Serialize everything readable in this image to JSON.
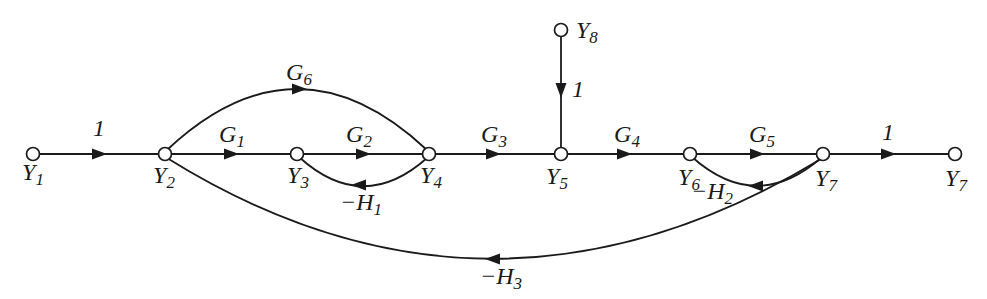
{
  "figure": {
    "type": "signal-flow-graph"
  },
  "colors": {
    "background": "#ffffff",
    "line": "#1a1a1a",
    "node_fill": "#ffffff"
  },
  "nodes": [
    {
      "id": "y1",
      "base": "Y",
      "sub": "1"
    },
    {
      "id": "y2",
      "base": "Y",
      "sub": "2"
    },
    {
      "id": "y3",
      "base": "Y",
      "sub": "3"
    },
    {
      "id": "y4",
      "base": "Y",
      "sub": "4"
    },
    {
      "id": "y5",
      "base": "Y",
      "sub": "5"
    },
    {
      "id": "y6",
      "base": "Y",
      "sub": "6"
    },
    {
      "id": "y7",
      "base": "Y",
      "sub": "7"
    },
    {
      "id": "y7-out",
      "base": "Y",
      "sub": "7"
    },
    {
      "id": "y8",
      "base": "Y",
      "sub": "8"
    }
  ],
  "edges": [
    {
      "id": "y1-y2",
      "from": "Y1",
      "to": "Y2",
      "label": "1",
      "sub": ""
    },
    {
      "id": "y2-y3",
      "from": "Y2",
      "to": "Y3",
      "label": "G",
      "sub": "1"
    },
    {
      "id": "y3-y4",
      "from": "Y3",
      "to": "Y4",
      "label": "G",
      "sub": "2"
    },
    {
      "id": "y4-y5",
      "from": "Y4",
      "to": "Y5",
      "label": "G",
      "sub": "3"
    },
    {
      "id": "y5-y6",
      "from": "Y5",
      "to": "Y6",
      "label": "G",
      "sub": "4"
    },
    {
      "id": "y6-y7",
      "from": "Y6",
      "to": "Y7",
      "label": "G",
      "sub": "5"
    },
    {
      "id": "y7-out",
      "from": "Y7",
      "to": "Y7",
      "label": "1",
      "sub": ""
    },
    {
      "id": "y8-y5",
      "from": "Y8",
      "to": "Y5",
      "label": "1",
      "sub": ""
    },
    {
      "id": "y2-y4",
      "from": "Y2",
      "to": "Y4",
      "label": "G",
      "sub": "6"
    },
    {
      "id": "y4-y3",
      "from": "Y4",
      "to": "Y3",
      "label": "−H",
      "sub": "1"
    },
    {
      "id": "y7-y6",
      "from": "Y7",
      "to": "Y6",
      "label": "−H",
      "sub": "2"
    },
    {
      "id": "y7-y2",
      "from": "Y7",
      "to": "Y2",
      "label": "−H",
      "sub": "3"
    }
  ]
}
